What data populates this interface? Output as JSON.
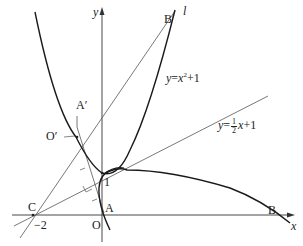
{
  "figure": {
    "axes": {
      "x_label": "x",
      "y_label": "y",
      "origin_label": "O"
    },
    "points": {
      "A": "A",
      "A_prime": "A′",
      "B": "B",
      "B_prime": "B′",
      "C": "C",
      "O_prime": "O′",
      "one": "1",
      "minus_two": "−2"
    },
    "line_l_label": "l",
    "parabola_label": {
      "lhs": "y",
      "eq": "=",
      "var": "x",
      "exp": "2",
      "rest": "+1"
    },
    "line_label": {
      "lhs": "y",
      "eq": "=",
      "num": "1",
      "den": "2",
      "var": "x",
      "rest": "+1"
    },
    "colors": {
      "curve": "#1a1a1a",
      "line": "#555555",
      "axis": "#333333"
    }
  }
}
